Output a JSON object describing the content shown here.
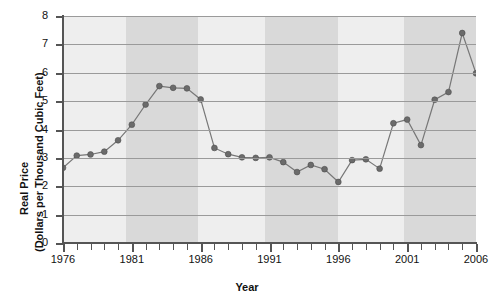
{
  "chart_data": {
    "type": "line",
    "title": "",
    "xlabel": "Year",
    "ylabel": "Real Price (Dollars per Thousand Cubic Feet)",
    "ylabel_line1": "Real Price",
    "ylabel_line2": "(Dollars per Thousand Cubic Feet)",
    "xlim": [
      1976,
      2006
    ],
    "ylim": [
      0,
      8
    ],
    "grid": true,
    "legend": "none",
    "y_ticks": [
      0,
      1,
      2,
      3,
      4,
      5,
      6,
      7,
      8
    ],
    "y_tick_labels": [
      "0",
      "1",
      "2",
      "3",
      "4",
      "5",
      "6",
      "7",
      "8"
    ],
    "x_ticks": [
      1976,
      1977,
      1978,
      1979,
      1980,
      1981,
      1982,
      1983,
      1984,
      1985,
      1986,
      1987,
      1988,
      1989,
      1990,
      1991,
      1992,
      1993,
      1994,
      1995,
      1996,
      1997,
      1998,
      1999,
      2000,
      2001,
      2002,
      2003,
      2004,
      2005,
      2006
    ],
    "x_tick_labels": [
      "1976",
      "1981",
      "1986",
      "1991",
      "1996",
      "2001",
      "2006"
    ],
    "x_labeled_years": [
      1976,
      1981,
      1986,
      1991,
      1996,
      2001,
      2006
    ],
    "x": [
      1976,
      1977,
      1978,
      1979,
      1980,
      1981,
      1982,
      1983,
      1984,
      1985,
      1986,
      1987,
      1988,
      1989,
      1990,
      1991,
      1992,
      1993,
      1994,
      1995,
      1996,
      1997,
      1998,
      1999,
      2000,
      2001,
      2002,
      2003,
      2004,
      2005,
      2006
    ],
    "values": [
      2.65,
      3.08,
      3.12,
      3.22,
      3.62,
      4.17,
      4.88,
      5.53,
      5.47,
      5.45,
      5.06,
      3.35,
      3.13,
      3.02,
      3.0,
      3.02,
      2.85,
      2.5,
      2.75,
      2.6,
      2.15,
      2.92,
      2.95,
      2.62,
      4.22,
      4.35,
      3.45,
      5.05,
      5.32,
      7.4,
      5.98
    ],
    "series": [
      {
        "name": "Real Price",
        "values": [
          2.65,
          3.08,
          3.12,
          3.22,
          3.62,
          4.17,
          4.88,
          5.53,
          5.47,
          5.45,
          5.06,
          3.35,
          3.13,
          3.02,
          3.0,
          3.02,
          2.85,
          2.5,
          2.75,
          2.6,
          2.15,
          2.92,
          2.95,
          2.62,
          4.22,
          4.35,
          3.45,
          5.05,
          5.32,
          7.4,
          5.98
        ]
      }
    ],
    "shaded_bands": [
      {
        "start": 1980.6,
        "end": 1985.8
      },
      {
        "start": 1990.7,
        "end": 1996.0
      },
      {
        "start": 2000.8,
        "end": 2006.0
      }
    ],
    "colors": {
      "plot_background": "#eeeeee",
      "band": "#d9d9d9",
      "gridline": "#9a9a9a",
      "line": "#777777",
      "marker": "#6b6b6b",
      "axis": "#555555",
      "text": "#111111"
    }
  }
}
